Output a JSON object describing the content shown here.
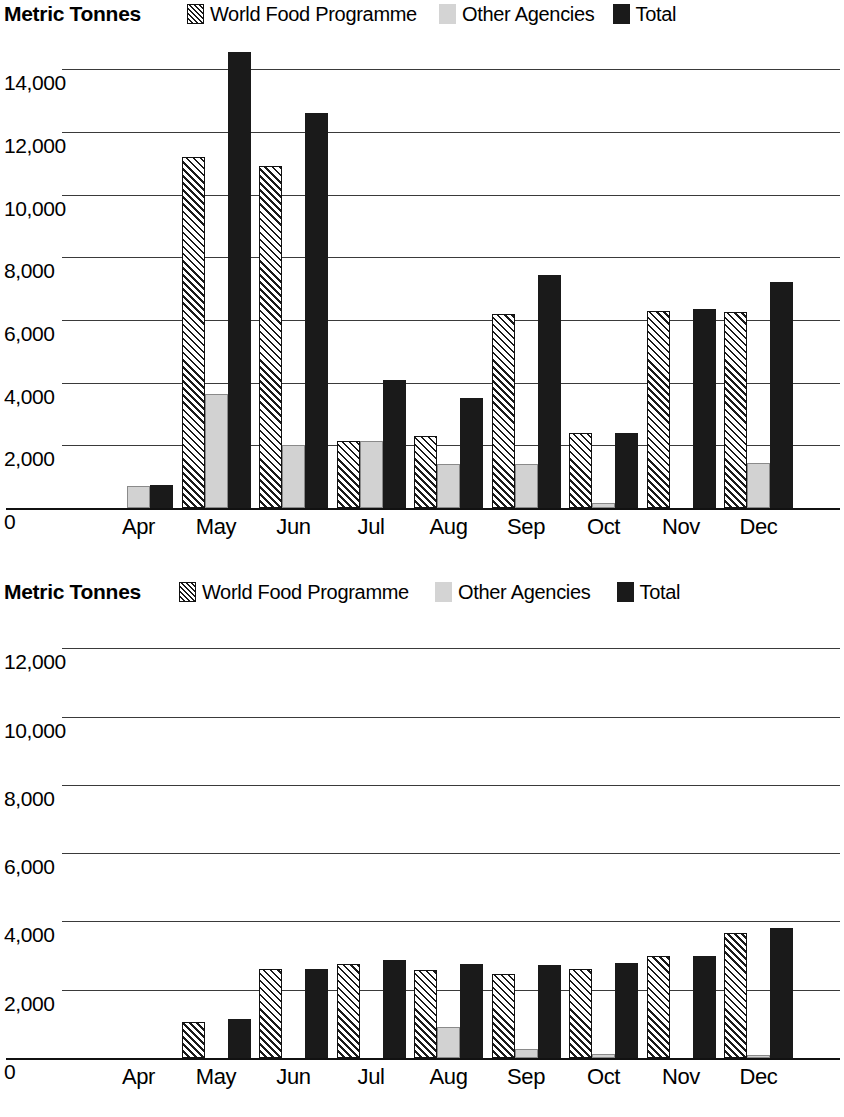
{
  "charts": [
    {
      "id": "chart-top",
      "axis_title": "Metric Tonnes",
      "legend": [
        {
          "key": "wfp",
          "label": "World Food Programme",
          "swatch": "hatched-swatch-icon",
          "color": "#ffffff"
        },
        {
          "key": "other",
          "label": "Other Agencies",
          "swatch": "light-grey-swatch-icon",
          "color": "#d2d2d2"
        },
        {
          "key": "total",
          "label": "Total",
          "swatch": "black-swatch-icon",
          "color": "#1a1a1a"
        }
      ],
      "yticks": [
        "14,000",
        "12,000",
        "10,000",
        "8,000",
        "6,000",
        "4,000",
        "2,000",
        "0"
      ],
      "chart_data": {
        "type": "bar",
        "title": "Metric Tonnes",
        "xlabel": "",
        "ylabel": "Metric Tonnes",
        "ylim": [
          0,
          15000
        ],
        "ytick_values": [
          0,
          2000,
          4000,
          6000,
          8000,
          10000,
          12000,
          14000
        ],
        "grid": true,
        "legend_position": "top",
        "categories": [
          "Apr",
          "May",
          "Jun",
          "Jul",
          "Aug",
          "Sep",
          "Oct",
          "Nov",
          "Dec"
        ],
        "series": [
          {
            "name": "World Food Programme",
            "values": [
              0,
              11200,
              10900,
              2150,
              2300,
              6200,
              2400,
              6300,
              6250
            ]
          },
          {
            "name": "Other Agencies",
            "values": [
              700,
              3650,
              2000,
              2150,
              1400,
              1400,
              150,
              0,
              1450
            ]
          },
          {
            "name": "Total",
            "values": [
              750,
              14550,
              12600,
              4100,
              3500,
              7450,
              2400,
              6350,
              7200
            ]
          }
        ]
      }
    },
    {
      "id": "chart-bottom",
      "axis_title": "Metric Tonnes",
      "legend": [
        {
          "key": "wfp",
          "label": "World Food Programme",
          "swatch": "hatched-swatch-icon",
          "color": "#ffffff"
        },
        {
          "key": "other",
          "label": "Other Agencies",
          "swatch": "light-grey-swatch-icon",
          "color": "#d2d2d2"
        },
        {
          "key": "total",
          "label": "Total",
          "swatch": "black-swatch-icon",
          "color": "#1a1a1a"
        }
      ],
      "yticks": [
        "12,000",
        "10,000",
        "8,000",
        "6,000",
        "4,000",
        "2,000",
        "0"
      ],
      "chart_data": {
        "type": "bar",
        "title": "Metric Tonnes",
        "xlabel": "",
        "ylabel": "Metric Tonnes",
        "ylim": [
          0,
          12600
        ],
        "ytick_values": [
          0,
          2000,
          4000,
          6000,
          8000,
          10000,
          12000
        ],
        "grid": true,
        "legend_position": "top",
        "categories": [
          "Apr",
          "May",
          "Jun",
          "Jul",
          "Aug",
          "Sep",
          "Oct",
          "Nov",
          "Dec"
        ],
        "series": [
          {
            "name": "World Food Programme",
            "values": [
              0,
              1050,
              2600,
              2750,
              2580,
              2450,
              2620,
              3000,
              3650
            ]
          },
          {
            "name": "Other Agencies",
            "values": [
              0,
              0,
              0,
              0,
              900,
              250,
              130,
              0,
              80
            ]
          },
          {
            "name": "Total",
            "values": [
              0,
              1150,
              2600,
              2880,
              2750,
              2720,
              2780,
              3000,
              3800
            ]
          }
        ]
      }
    }
  ]
}
